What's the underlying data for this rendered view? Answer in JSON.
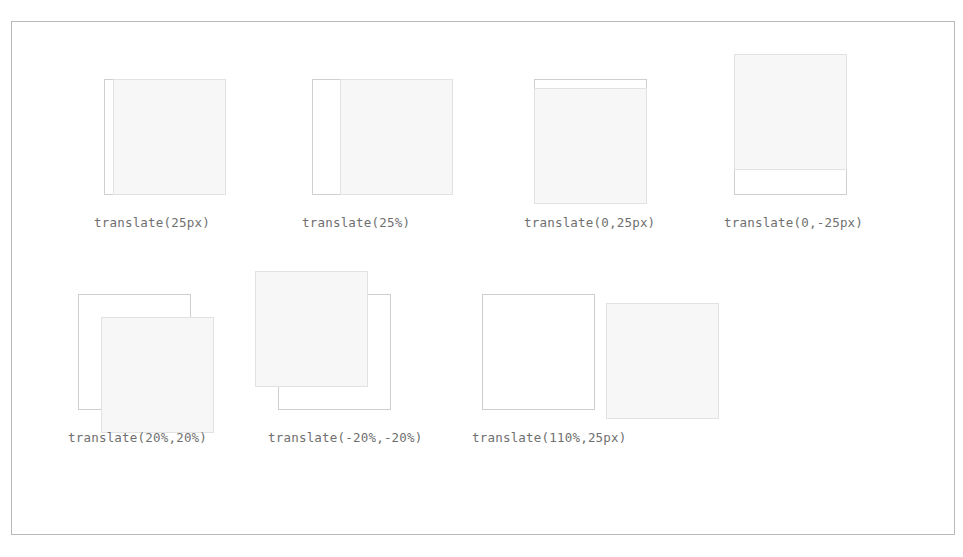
{
  "figure": {
    "border_color": "#b9b9b9",
    "background": "#ffffff",
    "reference_box_color": "#cfcfcf",
    "translated_box_fill": "#f7f7f7",
    "translated_box_border": "#e2e2e2",
    "label_color": "#6f6f6f",
    "box_width_px": 113,
    "box_height_px": 116
  },
  "rows": [
    {
      "cells": [
        {
          "label": "translate(25px)",
          "cell_left": 82,
          "translate_x": "25px",
          "translate_y": "0",
          "offset_x_px": 9,
          "offset_y_px": 0
        },
        {
          "label": "translate(25%)",
          "cell_left": 290,
          "translate_x": "25%",
          "translate_y": "0",
          "offset_x_px": 28,
          "offset_y_px": 0
        },
        {
          "label": "translate(0,25px)",
          "cell_left": 512,
          "translate_x": "0",
          "translate_y": "25px",
          "offset_x_px": 0,
          "offset_y_px": 9
        },
        {
          "label": "translate(0,-25px)",
          "cell_left": 712,
          "translate_x": "0",
          "translate_y": "-25px",
          "offset_x_px": 0,
          "offset_y_px": -25
        }
      ]
    },
    {
      "cells": [
        {
          "label": "translate(20%,20%)",
          "cell_left": 56,
          "translate_x": "20%",
          "translate_y": "20%",
          "offset_x_px": 23,
          "offset_y_px": 23
        },
        {
          "label": "translate(-20%,-20%)",
          "cell_left": 256,
          "translate_x": "-20%",
          "translate_y": "-20%",
          "offset_x_px": -23,
          "offset_y_px": -23
        },
        {
          "label": "translate(110%,25px)",
          "cell_left": 460,
          "translate_x": "110%",
          "translate_y": "25px",
          "offset_x_px": 124,
          "offset_y_px": 9
        }
      ]
    }
  ]
}
